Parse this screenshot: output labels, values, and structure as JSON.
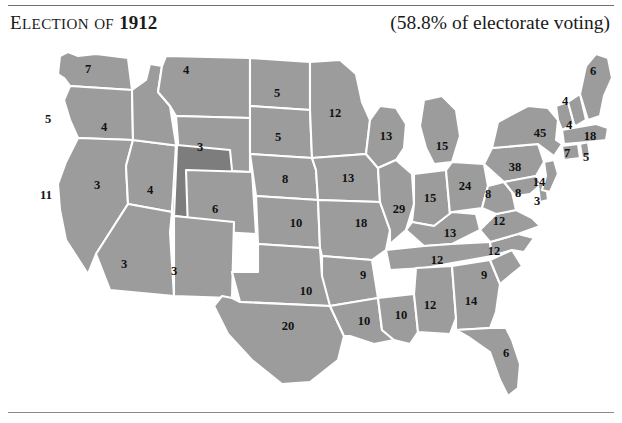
{
  "header": {
    "title_prefix": "E",
    "title_word1": "LECTION",
    "title_of": "OF",
    "title_of_prefix": "O",
    "title_of_rest": "F",
    "year": "1912",
    "turnout": "(58.8% of electorate voting)"
  },
  "map": {
    "name": "united-states-electoral-map",
    "fill_color": "#9c9c9c",
    "highlight_color": "#7d7d7d",
    "border_color": "#ffffff",
    "background_color": "#ffffff"
  },
  "states": [
    {
      "code": "WA",
      "name": "Washington",
      "votes": "7",
      "x": 88,
      "y": 26,
      "dark": false
    },
    {
      "code": "OR",
      "name": "Oregon",
      "votes": "5",
      "x": 48,
      "y": 76,
      "dark": false
    },
    {
      "code": "CA",
      "name": "California",
      "votes": "11",
      "x": 46,
      "y": 152,
      "dark": false
    },
    {
      "code": "NV",
      "name": "Nevada",
      "votes": "3",
      "x": 97,
      "y": 142,
      "dark": false
    },
    {
      "code": "ID",
      "name": "Idaho",
      "votes": "4",
      "x": 104,
      "y": 84,
      "dark": false
    },
    {
      "code": "MT",
      "name": "Montana",
      "votes": "4",
      "x": 186,
      "y": 27,
      "dark": false
    },
    {
      "code": "WY",
      "name": "Wyoming",
      "votes": "3",
      "x": 200,
      "y": 104,
      "dark": false
    },
    {
      "code": "UT",
      "name": "Utah",
      "votes": "4",
      "x": 150,
      "y": 147,
      "dark": true
    },
    {
      "code": "AZ",
      "name": "Arizona",
      "votes": "3",
      "x": 124,
      "y": 221,
      "dark": false
    },
    {
      "code": "NM",
      "name": "New Mexico",
      "votes": "3",
      "x": 174,
      "y": 228,
      "dark": false
    },
    {
      "code": "CO",
      "name": "Colorado",
      "votes": "6",
      "x": 215,
      "y": 166,
      "dark": false
    },
    {
      "code": "ND",
      "name": "North Dakota",
      "votes": "5",
      "x": 277,
      "y": 50,
      "dark": false
    },
    {
      "code": "SD",
      "name": "South Dakota",
      "votes": "5",
      "x": 278,
      "y": 94,
      "dark": false
    },
    {
      "code": "NE",
      "name": "Nebraska",
      "votes": "8",
      "x": 285,
      "y": 136,
      "dark": false
    },
    {
      "code": "KS",
      "name": "Kansas",
      "votes": "10",
      "x": 296,
      "y": 180,
      "dark": false
    },
    {
      "code": "OK",
      "name": "Oklahoma",
      "votes": "10",
      "x": 306,
      "y": 248,
      "dark": false
    },
    {
      "code": "TX",
      "name": "Texas",
      "votes": "20",
      "x": 288,
      "y": 283,
      "dark": false
    },
    {
      "code": "MN",
      "name": "Minnesota",
      "votes": "12",
      "x": 335,
      "y": 70,
      "dark": false
    },
    {
      "code": "IA",
      "name": "Iowa",
      "votes": "13",
      "x": 348,
      "y": 135,
      "dark": false
    },
    {
      "code": "MO",
      "name": "Missouri",
      "votes": "18",
      "x": 361,
      "y": 180,
      "dark": false
    },
    {
      "code": "AR",
      "name": "Arkansas",
      "votes": "9",
      "x": 363,
      "y": 232,
      "dark": false
    },
    {
      "code": "LA",
      "name": "Louisiana",
      "votes": "10",
      "x": 364,
      "y": 278,
      "dark": false
    },
    {
      "code": "MS",
      "name": "Mississippi",
      "votes": "10",
      "x": 401,
      "y": 272,
      "dark": false
    },
    {
      "code": "WI",
      "name": "Wisconsin",
      "votes": "13",
      "x": 386,
      "y": 93,
      "dark": false
    },
    {
      "code": "IL",
      "name": "Illinois",
      "votes": "29",
      "x": 399,
      "y": 166,
      "dark": false
    },
    {
      "code": "MI",
      "name": "Michigan",
      "votes": "15",
      "x": 442,
      "y": 103,
      "dark": false
    },
    {
      "code": "IN",
      "name": "Indiana",
      "votes": "15",
      "x": 430,
      "y": 155,
      "dark": false
    },
    {
      "code": "OH",
      "name": "Ohio",
      "votes": "24",
      "x": 465,
      "y": 143,
      "dark": false
    },
    {
      "code": "KY",
      "name": "Kentucky",
      "votes": "13",
      "x": 450,
      "y": 190,
      "dark": false
    },
    {
      "code": "TN",
      "name": "Tennessee",
      "votes": "12",
      "x": 437,
      "y": 217,
      "dark": false
    },
    {
      "code": "AL",
      "name": "Alabama",
      "votes": "12",
      "x": 430,
      "y": 262,
      "dark": false
    },
    {
      "code": "GA",
      "name": "Georgia",
      "votes": "14",
      "x": 471,
      "y": 258,
      "dark": false
    },
    {
      "code": "FL",
      "name": "Florida",
      "votes": "6",
      "x": 506,
      "y": 310,
      "dark": false
    },
    {
      "code": "SC",
      "name": "South Carolina",
      "votes": "9",
      "x": 484,
      "y": 232,
      "dark": false
    },
    {
      "code": "NC",
      "name": "North Carolina",
      "votes": "12",
      "x": 494,
      "y": 208,
      "dark": false
    },
    {
      "code": "VA",
      "name": "Virginia",
      "votes": "12",
      "x": 499,
      "y": 178,
      "dark": false
    },
    {
      "code": "WV",
      "name": "West Virginia",
      "votes": "8",
      "x": 488,
      "y": 151,
      "dark": false
    },
    {
      "code": "MD",
      "name": "Maryland",
      "votes": "8",
      "x": 518,
      "y": 150,
      "dark": false
    },
    {
      "code": "DE",
      "name": "Delaware",
      "votes": "3",
      "x": 537,
      "y": 158,
      "dark": false
    },
    {
      "code": "NJ",
      "name": "New Jersey",
      "votes": "14",
      "x": 539,
      "y": 139,
      "dark": false
    },
    {
      "code": "PA",
      "name": "Pennsylvania",
      "votes": "38",
      "x": 515,
      "y": 124,
      "dark": false
    },
    {
      "code": "NY",
      "name": "New York",
      "votes": "45",
      "x": 540,
      "y": 90,
      "dark": false
    },
    {
      "code": "CT",
      "name": "Connecticut",
      "votes": "7",
      "x": 567,
      "y": 110,
      "dark": false
    },
    {
      "code": "RI",
      "name": "Rhode Island",
      "votes": "5",
      "x": 586,
      "y": 114,
      "dark": false
    },
    {
      "code": "MA",
      "name": "Massachusetts",
      "votes": "18",
      "x": 590,
      "y": 93,
      "dark": false
    },
    {
      "code": "VT",
      "name": "Vermont",
      "votes": "4",
      "x": 569,
      "y": 82,
      "dark": false
    },
    {
      "code": "NH",
      "name": "New Hampshire",
      "votes": "4",
      "x": 565,
      "y": 58,
      "dark": false
    },
    {
      "code": "ME",
      "name": "Maine",
      "votes": "6",
      "x": 593,
      "y": 28,
      "dark": false
    }
  ]
}
